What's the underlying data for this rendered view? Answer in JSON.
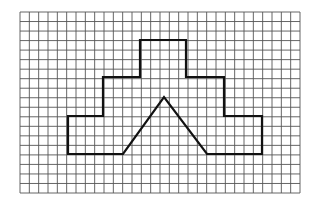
{
  "figure": {
    "background": "#ffffff",
    "grid": {
      "left": 20,
      "top": 12,
      "right": 300,
      "bottom": 193,
      "columns": 30,
      "rows": 19,
      "line_color": "#555555",
      "line_width": 0.9
    },
    "shape": {
      "stroke": "#111111",
      "stroke_width": 2.2,
      "outline_points": [
        [
          123,
          154
        ],
        [
          68,
          154
        ],
        [
          68,
          116
        ],
        [
          103,
          116
        ],
        [
          103,
          77
        ],
        [
          140,
          77
        ],
        [
          140,
          40
        ],
        [
          186,
          40
        ],
        [
          186,
          77
        ],
        [
          224,
          77
        ],
        [
          224,
          116
        ],
        [
          262,
          116
        ],
        [
          262,
          154
        ],
        [
          207,
          154
        ],
        [
          164,
          97
        ]
      ]
    }
  }
}
